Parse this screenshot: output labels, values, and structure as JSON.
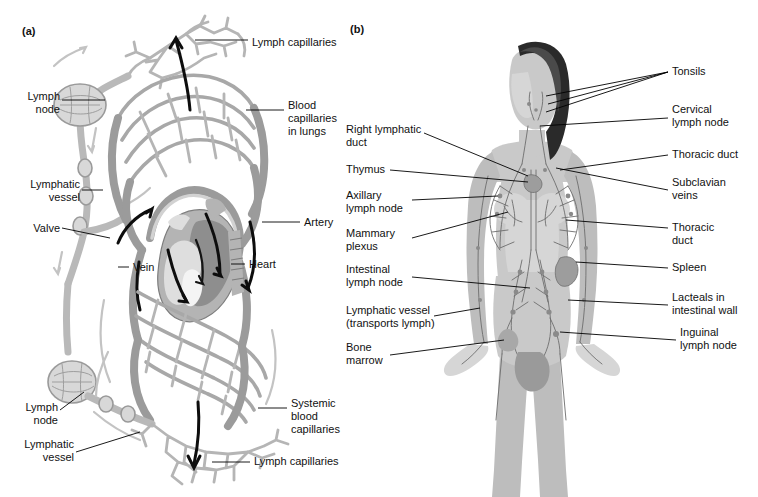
{
  "figure": {
    "background": "#ffffff",
    "ink": "#111111"
  },
  "panels": [
    {
      "id": "a",
      "tag": "(a)",
      "caption": "Relationship of lymphatic vessels to the cardiovascular system"
    },
    {
      "id": "b",
      "tag": "(b)",
      "caption": "Lymphatic organs and vessels of the human body"
    }
  ],
  "panel_a": {
    "tag": "(a)",
    "labels": [
      {
        "name": "lymph-capillaries-top",
        "text": "Lymph capillaries",
        "align": "left",
        "x": 252,
        "y": 36
      },
      {
        "name": "lymph-node-top",
        "text": "Lymph\nnode",
        "align": "right",
        "x": 20,
        "y": 90
      },
      {
        "name": "blood-capillaries-lungs",
        "text": "Blood\ncapillaries\nin lungs",
        "align": "left",
        "x": 288,
        "y": 99
      },
      {
        "name": "lymphatic-vessel-top",
        "text": "Lymphatic\nvessel",
        "align": "right",
        "x": 20,
        "y": 178
      },
      {
        "name": "artery",
        "text": "Artery",
        "align": "left",
        "x": 304,
        "y": 216
      },
      {
        "name": "valve",
        "text": "Valve",
        "align": "right",
        "x": 20,
        "y": 222
      },
      {
        "name": "heart",
        "text": "Heart",
        "align": "left",
        "x": 249,
        "y": 258
      },
      {
        "name": "vein",
        "text": "Vein",
        "align": "left",
        "x": 133,
        "y": 261
      },
      {
        "name": "systemic-blood-capillaries",
        "text": "Systemic\nblood\ncapillaries",
        "align": "left",
        "x": 291,
        "y": 397
      },
      {
        "name": "lymph-node-bottom",
        "text": "Lymph\nnode",
        "align": "right",
        "x": 20,
        "y": 401
      },
      {
        "name": "lymphatic-vessel-bottom",
        "text": "Lymphatic\nvessel",
        "align": "right",
        "x": 20,
        "y": 438
      },
      {
        "name": "lymph-capillaries-bottom",
        "text": "Lymph capillaries",
        "align": "left",
        "x": 254,
        "y": 455
      }
    ]
  },
  "panel_b": {
    "tag": "(b)",
    "labels_left": [
      {
        "name": "right-lymphatic-duct",
        "text": "Right lymphatic\nduct",
        "x": 346,
        "y": 123
      },
      {
        "name": "thymus",
        "text": "Thymus",
        "x": 346,
        "y": 163
      },
      {
        "name": "axillary-lymph-node",
        "text": "Axillary\nlymph node",
        "x": 346,
        "y": 189
      },
      {
        "name": "mammary-plexus",
        "text": "Mammary\nplexus",
        "x": 346,
        "y": 227
      },
      {
        "name": "intestinal-lymph-node",
        "text": "Intestinal\nlymph node",
        "x": 346,
        "y": 263
      },
      {
        "name": "lymphatic-vessel-transports",
        "text": "Lymphatic vessel\n(transports lymph)",
        "x": 346,
        "y": 304
      },
      {
        "name": "bone-marrow",
        "text": "Bone\nmarrow",
        "x": 346,
        "y": 341
      }
    ],
    "labels_right": [
      {
        "name": "tonsils",
        "text": "Tonsils",
        "x": 672,
        "y": 65
      },
      {
        "name": "cervical-lymph-node",
        "text": "Cervical\nlymph node",
        "x": 672,
        "y": 103
      },
      {
        "name": "thoracic-duct-upper",
        "text": "Thoracic duct",
        "x": 672,
        "y": 148
      },
      {
        "name": "subclavian-veins",
        "text": "Subclavian\nveins",
        "x": 672,
        "y": 176
      },
      {
        "name": "thoracic-duct-lower",
        "text": "Thoracic\nduct",
        "x": 672,
        "y": 221
      },
      {
        "name": "spleen",
        "text": "Spleen",
        "x": 672,
        "y": 261
      },
      {
        "name": "lacteals-intestinal-wall",
        "text": "Lacteals in\nintestinal wall",
        "x": 672,
        "y": 291
      },
      {
        "name": "inguinal-lymph-node",
        "text": "Inguinal\nlymph node",
        "x": 680,
        "y": 326
      }
    ]
  },
  "colors": {
    "lymph_vessel": "#b9b9b9",
    "blood_vessel": "#9b9b9b",
    "flow_arrow": "#0d0d0d",
    "label_text": "#111111",
    "page_background": "#ffffff"
  }
}
